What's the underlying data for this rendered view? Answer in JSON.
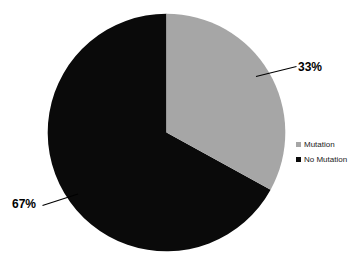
{
  "chart_data": {
    "type": "pie",
    "title": "",
    "categories": [
      "Mutation",
      "No Mutation"
    ],
    "values": [
      33,
      67
    ],
    "unit": "%",
    "data_labels": [
      "33%",
      "67%"
    ],
    "colors": [
      "#a6a6a6",
      "#0a0a0a"
    ],
    "legend": {
      "position": "right",
      "entries": [
        {
          "label": "Mutation",
          "color": "#a6a6a6",
          "value": 33
        },
        {
          "label": "No Mutation",
          "color": "#0a0a0a",
          "value": 67
        }
      ]
    },
    "start_angle_deg": 0,
    "direction": "clockwise",
    "grid": false,
    "background": "#ffffff"
  },
  "labels": {
    "mutation_pct": "33%",
    "no_mutation_pct": "67%"
  },
  "legend": {
    "mutation_label": "Mutation",
    "no_mutation_label": "No Mutation"
  }
}
